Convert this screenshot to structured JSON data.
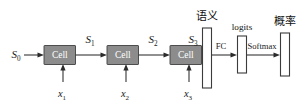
{
  "figure": {
    "type": "rnn-unrolled-architecture-diagram",
    "canvas": {
      "width": 305,
      "height": 104
    },
    "colors": {
      "cell_fill": "#8c8c8c",
      "cell_stroke": "#3f3f3f",
      "vector_fill": "#ffffff",
      "vector_stroke": "#3b3b3b",
      "line": "#2b2b2b",
      "text": "#111111",
      "cell_text": "#ffffff",
      "background": "#ffffff"
    }
  },
  "states": {
    "s0": {
      "base": "S",
      "sub": "0"
    },
    "s1": {
      "base": "S",
      "sub": "1"
    },
    "s2": {
      "base": "S",
      "sub": "2"
    },
    "s3": {
      "base": "S",
      "sub": "3"
    }
  },
  "cells": [
    {
      "label": "Cell"
    },
    {
      "label": "Cell"
    },
    {
      "label": "Cell"
    }
  ],
  "inputs": [
    {
      "base": "x",
      "sub": "1"
    },
    {
      "base": "x",
      "sub": "2"
    },
    {
      "base": "x",
      "sub": "3"
    }
  ],
  "vectors": [
    {
      "name": "semantic-vector",
      "label": "语义",
      "script": "cjk"
    },
    {
      "name": "logits-vector",
      "label": "logits",
      "script": "latin"
    },
    {
      "name": "probability-vector",
      "label": "概率",
      "script": "cjk"
    }
  ],
  "operations": [
    {
      "name": "fc-op",
      "label": "FC"
    },
    {
      "name": "softmax-op",
      "label": "Softmax"
    }
  ]
}
